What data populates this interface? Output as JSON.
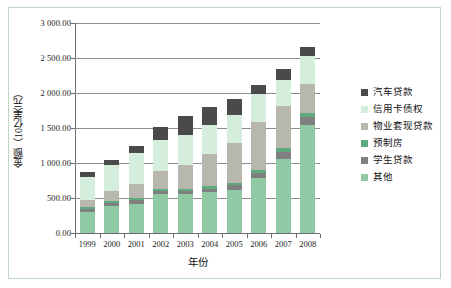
{
  "chart_data": {
    "type": "bar",
    "subtype": "stacked-column",
    "title": "",
    "xlabel": "年份",
    "ylabel": "金额（10亿美元）",
    "categories": [
      "1999",
      "2000",
      "2001",
      "2002",
      "2003",
      "2004",
      "2005",
      "2006",
      "2007",
      "2008"
    ],
    "ylim": [
      0,
      3000
    ],
    "ytick_values": [
      0,
      500,
      1000,
      1500,
      2000,
      2500,
      3000
    ],
    "ytick_labels": [
      "0.00",
      "500.00",
      "1 000.00",
      "1 500.00",
      "2 000.00",
      "2 500.00",
      "3 000.00"
    ],
    "grid": true,
    "grid_axis": "y",
    "legend_position": "right",
    "stack_order_bottom_to_top": [
      "其他",
      "学生贷款",
      "预制房",
      "物业套现贷款",
      "信用卡债权",
      "汽车贷款"
    ],
    "series": [
      {
        "name": "其他",
        "color": "#8fcaa5",
        "values": [
          300,
          390,
          420,
          560,
          560,
          580,
          610,
          780,
          1060,
          1540
        ]
      },
      {
        "name": "学生贷款",
        "color": "#808080",
        "values": [
          45,
          45,
          55,
          40,
          45,
          50,
          70,
          80,
          100,
          120
        ]
      },
      {
        "name": "预制房",
        "color": "#5faa7c",
        "values": [
          25,
          25,
          25,
          30,
          30,
          35,
          40,
          45,
          50,
          55
        ]
      },
      {
        "name": "物业套现贷款",
        "color": "#b7b7ae",
        "values": [
          100,
          140,
          200,
          260,
          330,
          460,
          560,
          680,
          600,
          420
        ]
      },
      {
        "name": "信用卡债权",
        "color": "#d4eddc",
        "values": [
          330,
          370,
          440,
          440,
          440,
          420,
          400,
          400,
          370,
          400
        ]
      },
      {
        "name": "汽车贷款",
        "color": "#4a4a4a",
        "values": [
          75,
          80,
          110,
          180,
          270,
          260,
          230,
          130,
          170,
          120
        ]
      }
    ],
    "totals": [
      875,
      1050,
      1250,
      1510,
      1675,
      1805,
      1910,
      2115,
      2350,
      2655
    ]
  },
  "legend": {
    "items": [
      {
        "label": "汽车贷款",
        "color": "#4a4a4a"
      },
      {
        "label": "信用卡债权",
        "color": "#d4eddc"
      },
      {
        "label": "物业套现贷款",
        "color": "#b7b7ae"
      },
      {
        "label": "预制房",
        "color": "#5faa7c"
      },
      {
        "label": "学生贷款",
        "color": "#808080"
      },
      {
        "label": "其他",
        "color": "#8fcaa5"
      }
    ]
  },
  "style": {
    "frame_border_color": "#bfd6c4",
    "grid_color": "#8e8e8e",
    "axis_color": "#6d6d6d",
    "background": "#ffffff"
  }
}
